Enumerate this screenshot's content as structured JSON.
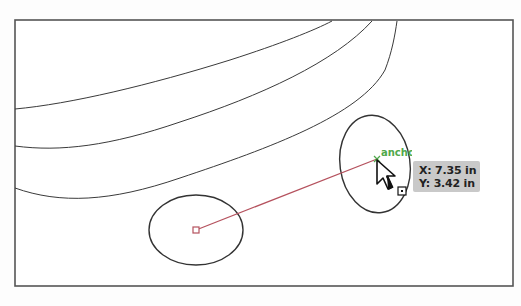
{
  "artboard": {
    "frame": {
      "x": 15,
      "y": 20,
      "width": 498,
      "height": 266,
      "stroke": "#555555"
    },
    "curves": [
      {
        "name": "curve-1",
        "d": "M15,109 C70,104 150,85 230,60 C280,44 315,30 332,21"
      },
      {
        "name": "curve-2",
        "d": "M15,146 C60,152 110,146 180,122 C260,96 335,62 372,21"
      },
      {
        "name": "curve-3",
        "d": "M15,188 C60,204 110,202 180,178 C270,148 360,115 385,70 C392,52 395,35 397,21"
      }
    ]
  },
  "shapes": {
    "left_ellipse": {
      "cx": 196,
      "cy": 230,
      "rx": 47,
      "ry": 35,
      "stroke": "#333333"
    },
    "right_ellipse": {
      "cx": 375,
      "cy": 164,
      "rx": 35,
      "ry": 49,
      "rotate": -8,
      "stroke": "#333333"
    }
  },
  "guide_line": {
    "x1": 196,
    "y1": 230,
    "x2": 377,
    "y2": 159,
    "color": "#b5525e"
  },
  "center_marker": {
    "x": 196,
    "y": 230,
    "color": "#b5525e"
  },
  "smart_guide": {
    "label": "anchor",
    "color": "#4fa84a"
  },
  "coordinates_tooltip": {
    "x_label": "X: 7.35 in",
    "y_label": "Y: 3.42 in",
    "background": "#c9c9c9"
  },
  "cursor": {
    "icon": "direct-selection-arrow-icon",
    "x": 377,
    "y": 160
  }
}
